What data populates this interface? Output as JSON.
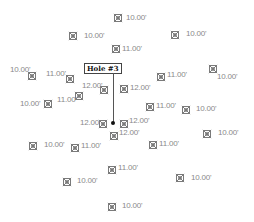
{
  "hole": {
    "label": "Hole #3",
    "x": 113,
    "y": 123
  },
  "unit_suffix": "'",
  "markers": [
    {
      "x": 118,
      "y": 18,
      "depth": "10.00'",
      "lx": 126,
      "ly": 14
    },
    {
      "x": 73,
      "y": 36,
      "depth": "10.00'",
      "lx": 84,
      "ly": 32
    },
    {
      "x": 175,
      "y": 35,
      "depth": "10.00'",
      "lx": 186,
      "ly": 30
    },
    {
      "x": 116,
      "y": 49,
      "depth": "11.00'",
      "lx": 122,
      "ly": 45
    },
    {
      "x": 32,
      "y": 76,
      "depth": "10.00'",
      "lx": 10,
      "ly": 66
    },
    {
      "x": 70,
      "y": 79,
      "depth": "11.00'",
      "lx": 46,
      "ly": 70
    },
    {
      "x": 213,
      "y": 69,
      "depth": "10.00'",
      "lx": 217,
      "ly": 73
    },
    {
      "x": 161,
      "y": 77,
      "depth": "11.00'",
      "lx": 167,
      "ly": 71
    },
    {
      "x": 104,
      "y": 90,
      "depth": "12.00'",
      "lx": 82,
      "ly": 82
    },
    {
      "x": 124,
      "y": 89,
      "depth": "12.00'",
      "lx": 130,
      "ly": 84
    },
    {
      "x": 79,
      "y": 96,
      "depth": "11.00'",
      "lx": 57,
      "ly": 96
    },
    {
      "x": 48,
      "y": 104,
      "depth": "10.00'",
      "lx": 20,
      "ly": 100
    },
    {
      "x": 150,
      "y": 107,
      "depth": "11.00'",
      "lx": 156,
      "ly": 102
    },
    {
      "x": 186,
      "y": 110,
      "depth": "10.00'",
      "lx": 196,
      "ly": 105
    },
    {
      "x": 103,
      "y": 124,
      "depth": "12.00'",
      "lx": 80,
      "ly": 119
    },
    {
      "x": 124,
      "y": 124,
      "depth": "12.00'",
      "lx": 129,
      "ly": 117
    },
    {
      "x": 114,
      "y": 136,
      "depth": "12.00'",
      "lx": 119,
      "ly": 129
    },
    {
      "x": 207,
      "y": 134,
      "depth": "10.00'",
      "lx": 218,
      "ly": 129
    },
    {
      "x": 33,
      "y": 146,
      "depth": "10.00'",
      "lx": 44,
      "ly": 141
    },
    {
      "x": 75,
      "y": 148,
      "depth": "11.00'",
      "lx": 81,
      "ly": 142
    },
    {
      "x": 153,
      "y": 145,
      "depth": "11.00'",
      "lx": 159,
      "ly": 140
    },
    {
      "x": 112,
      "y": 170,
      "depth": "11.00'",
      "lx": 118,
      "ly": 164
    },
    {
      "x": 67,
      "y": 182,
      "depth": "10.00'",
      "lx": 77,
      "ly": 177
    },
    {
      "x": 180,
      "y": 178,
      "depth": "10.00'",
      "lx": 191,
      "ly": 174
    },
    {
      "x": 112,
      "y": 207,
      "depth": "10.00'",
      "lx": 122,
      "ly": 202
    }
  ]
}
